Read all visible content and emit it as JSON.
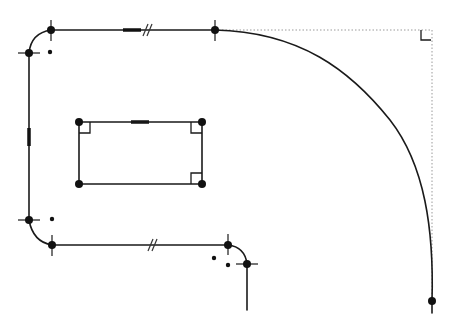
{
  "canvas": {
    "width": 454,
    "height": 330,
    "background": "#ffffff"
  },
  "colors": {
    "geometry": "#1a1a1a",
    "construction": "#9a9a9a",
    "vertex": "#111111"
  },
  "outer_profile": {
    "segments": [
      {
        "type": "line",
        "name": "top-line",
        "from": [
          51,
          30
        ],
        "to": [
          215,
          30
        ]
      },
      {
        "type": "spline",
        "name": "large-curve",
        "from": [
          215,
          30
        ],
        "to": [
          432,
          301
        ]
      },
      {
        "type": "line",
        "name": "curve-tail",
        "from": [
          432,
          301
        ],
        "to": [
          432,
          313
        ]
      },
      {
        "type": "arc",
        "name": "top-left-fillet",
        "from": [
          29,
          53
        ],
        "to": [
          51,
          30
        ]
      },
      {
        "type": "line",
        "name": "left-line",
        "from": [
          29,
          53
        ],
        "to": [
          29,
          220
        ]
      },
      {
        "type": "arc",
        "name": "bottom-left-fillet",
        "from": [
          29,
          220
        ],
        "to": [
          52,
          245
        ]
      },
      {
        "type": "line",
        "name": "bottom-line",
        "from": [
          52,
          245
        ],
        "to": [
          228,
          245
        ]
      },
      {
        "type": "arc",
        "name": "bottom-right-fillet",
        "from": [
          228,
          245
        ],
        "to": [
          247,
          264
        ]
      },
      {
        "type": "line",
        "name": "right-stub",
        "from": [
          247,
          264
        ],
        "to": [
          247,
          310
        ]
      }
    ],
    "vertices": [
      [
        51,
        30
      ],
      [
        215,
        30
      ],
      [
        29,
        53
      ],
      [
        29,
        220
      ],
      [
        52,
        245
      ],
      [
        228,
        245
      ],
      [
        247,
        264
      ],
      [
        432,
        301
      ]
    ],
    "arc_centers": [
      [
        50,
        52
      ],
      [
        52,
        219
      ],
      [
        214,
        258
      ],
      [
        228,
        265
      ]
    ]
  },
  "inner_rectangle": {
    "corners": [
      [
        79,
        122
      ],
      [
        202,
        122
      ],
      [
        202,
        184
      ],
      [
        79,
        184
      ]
    ],
    "perpendicular_marks": [
      "top-left",
      "top-right",
      "bottom-right"
    ]
  },
  "construction_lines": [
    {
      "from": [
        215,
        30
      ],
      "to": [
        432,
        30
      ]
    },
    {
      "from": [
        432,
        30
      ],
      "to": [
        432,
        301
      ]
    }
  ],
  "constraints": {
    "horizontal_marks": [
      [
        123,
        30,
        141,
        30
      ],
      [
        131,
        122,
        149,
        122
      ]
    ],
    "vertical_marks": [
      [
        29,
        128,
        29,
        146
      ]
    ],
    "parallel_marks": [
      [
        147,
        30
      ],
      [
        152,
        245
      ]
    ],
    "right_angle_construction": [
      432,
      30
    ]
  }
}
